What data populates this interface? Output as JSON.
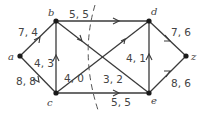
{
  "diagram": {
    "type": "flow-network",
    "nodes": [
      {
        "id": "a",
        "label": "a"
      },
      {
        "id": "b",
        "label": "b"
      },
      {
        "id": "c",
        "label": "c"
      },
      {
        "id": "d",
        "label": "d"
      },
      {
        "id": "e",
        "label": "e"
      },
      {
        "id": "z",
        "label": "z"
      }
    ],
    "edges": [
      {
        "from": "a",
        "to": "b",
        "label": "7, 4"
      },
      {
        "from": "a",
        "to": "c",
        "label": "8, 8"
      },
      {
        "from": "c",
        "to": "b",
        "label": "4, 3"
      },
      {
        "from": "b",
        "to": "d",
        "label": "5, 5"
      },
      {
        "from": "b",
        "to": "e",
        "label": "3, 2"
      },
      {
        "from": "d",
        "to": "c",
        "label": "4, 0"
      },
      {
        "from": "e",
        "to": "d",
        "label": "4, 1"
      },
      {
        "from": "c",
        "to": "e",
        "label": "5, 5"
      },
      {
        "from": "d",
        "to": "z",
        "label": "7, 6"
      },
      {
        "from": "e",
        "to": "z",
        "label": "8, 6"
      }
    ],
    "cut": "dashed curve separating {a, b, c} from {d, e, z}"
  }
}
